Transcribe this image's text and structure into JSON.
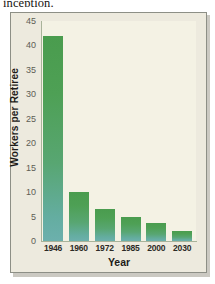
{
  "page": {
    "cut_off_text_above_figure": "inception."
  },
  "chart_data": {
    "type": "bar",
    "title": "",
    "xlabel": "Year",
    "ylabel": "Workers per Retiree",
    "categories": [
      "1946",
      "1960",
      "1972",
      "1985",
      "2000",
      "2030"
    ],
    "values": [
      42,
      10,
      6.5,
      5,
      3.7,
      2
    ],
    "ylim": [
      0,
      45
    ],
    "yticks": [
      0,
      5,
      10,
      15,
      20,
      25,
      30,
      35,
      40,
      45
    ],
    "ytick_labels": [
      "0",
      "5",
      "10",
      "15",
      "20",
      "25",
      "30",
      "35",
      "40",
      "45"
    ],
    "grid": false,
    "legend": null,
    "colors": {
      "bar_top": "#4a9c4e",
      "bar_bottom": "#6cb0ad",
      "plot_background": "#f4f2e4",
      "figure_background": "#edeade",
      "frame_border": "#8d8f86",
      "axis_line": "#a9b39a",
      "tick_label": "#5d5d55",
      "axis_title": "#1d1b18"
    }
  }
}
